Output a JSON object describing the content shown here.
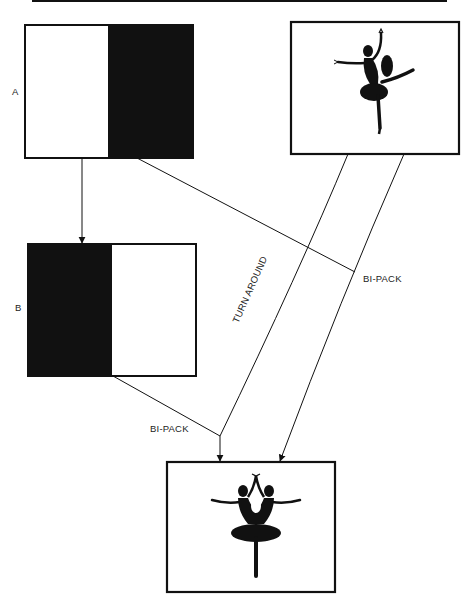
{
  "diagram": {
    "type": "film optical printing flow (bi-pack / turnaround)",
    "nodes": [
      {
        "id": "A",
        "label": "A",
        "content": "matte: white left half, black right half"
      },
      {
        "id": "source",
        "label": "",
        "content": "ballerina silhouette on white"
      },
      {
        "id": "B",
        "label": "B",
        "content": "counter-matte: black left half, white right half"
      },
      {
        "id": "result",
        "label": "",
        "content": "mirrored twin ballerina silhouettes"
      }
    ],
    "edges": [
      {
        "from": "A",
        "to": "B",
        "label": ""
      },
      {
        "from": "A",
        "to": "source-path",
        "label": "BI-PACK"
      },
      {
        "from": "source",
        "to": "result",
        "label": "TURN AROUND"
      },
      {
        "from": "source",
        "to": "result",
        "label": ""
      },
      {
        "from": "B",
        "to": "result",
        "label": "BI-PACK"
      }
    ]
  },
  "labels": {
    "a": "A",
    "b": "B",
    "bipack_upper": "BI-PACK",
    "bipack_lower": "BI-PACK",
    "turn_around": "TURN AROUND"
  },
  "colors": {
    "ink": "#111111",
    "paper": "#ffffff"
  }
}
